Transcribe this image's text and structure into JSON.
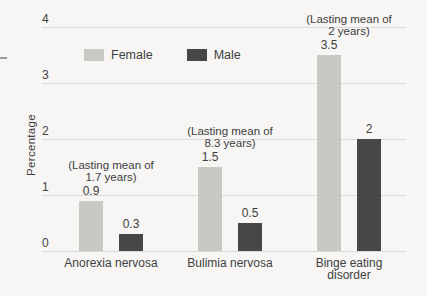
{
  "figure": {
    "background": "#f7f6f4",
    "text_color": "#3e3e3e",
    "gridline_color": "#dbdad7"
  },
  "legend": {
    "items": [
      {
        "label": "Female",
        "color": "#c8c9c3"
      },
      {
        "label": "Male",
        "color": "#474747"
      }
    ]
  },
  "chart_data": {
    "type": "bar",
    "title": "",
    "xlabel": "",
    "ylabel": "Percentage",
    "ylim": [
      0,
      4
    ],
    "yticks": [
      0,
      1,
      2,
      3,
      4
    ],
    "grid": true,
    "legend_position": "top-left inside plot",
    "categories": [
      "Anorexia nervosa",
      "Bulimia nervosa",
      "Binge eating disorder"
    ],
    "series": [
      {
        "name": "Female",
        "color": "#c8c9c3",
        "values": [
          0.9,
          1.5,
          3.5
        ],
        "labels": [
          "0.9",
          "1.5",
          "3.5"
        ]
      },
      {
        "name": "Male",
        "color": "#474747",
        "values": [
          0.3,
          0.5,
          2
        ],
        "labels": [
          "0.3",
          "0.5",
          "2"
        ]
      }
    ],
    "annotations": [
      {
        "category_index": 0,
        "lines": [
          "(Lasting mean of",
          "1.7 years)"
        ]
      },
      {
        "category_index": 1,
        "lines": [
          "(Lasting mean of",
          "8.3 years)"
        ]
      },
      {
        "category_index": 2,
        "lines": [
          "(Lasting mean of",
          "2 years)"
        ]
      }
    ]
  }
}
